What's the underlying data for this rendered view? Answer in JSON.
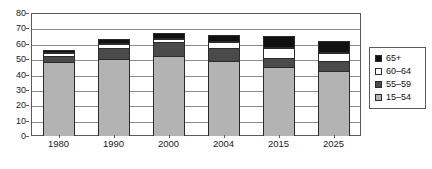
{
  "chart_data": {
    "type": "bar",
    "subtype": "stacked-column",
    "title": "",
    "subtitle": "",
    "xlabel": "",
    "ylabel": "",
    "categories": [
      "1980",
      "1990",
      "2000",
      "2004",
      "2015",
      "2025"
    ],
    "series": [
      {
        "name": "15–54",
        "color": "#b3b3b3",
        "values": [
          48,
          50,
          52,
          49,
          45,
          42
        ]
      },
      {
        "name": "55–59",
        "color": "#4a4a4a",
        "values": [
          4,
          7,
          9,
          8,
          6,
          7
        ]
      },
      {
        "name": "60–64",
        "color": "#ffffff",
        "values": [
          2,
          3,
          2,
          4,
          6,
          5
        ]
      },
      {
        "name": "65+",
        "color": "#111111",
        "values": [
          2,
          3,
          4,
          5,
          8,
          8
        ]
      }
    ],
    "totals": [
      56,
      63,
      67,
      66,
      65,
      62
    ],
    "ylim": [
      0,
      80
    ],
    "yticks": [
      0,
      10,
      20,
      30,
      40,
      50,
      60,
      70,
      80
    ],
    "ytick_labels": [
      "0",
      "10",
      "20",
      "30",
      "40",
      "50",
      "60",
      "70",
      "80"
    ],
    "grid": true,
    "grid_axis": "y",
    "legend_position": "right",
    "legend_entries": [
      {
        "label": "65+",
        "color": "#111111"
      },
      {
        "label": "60–64",
        "color": "#ffffff"
      },
      {
        "label": "55–59",
        "color": "#4a4a4a"
      },
      {
        "label": "15–54",
        "color": "#b3b3b3"
      }
    ]
  },
  "colors": {
    "frame": "#5a5a5a",
    "gridline": "#8c8c8c",
    "bar_outline": "#2b2b2b",
    "text": "#1a1a1a",
    "background": "#ffffff"
  }
}
